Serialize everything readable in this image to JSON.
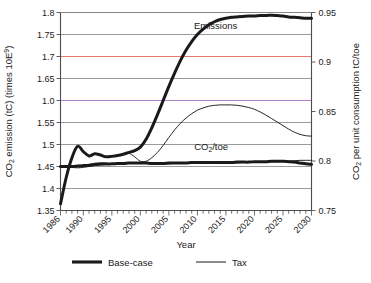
{
  "chart_data": {
    "type": "line",
    "title": "",
    "xlabel": "Year",
    "ylabel": "CO2 emission (tC) (times 10E9)",
    "ylabel_parts": {
      "pre": "CO",
      "sub": "2",
      "mid": " emission (tC) (times 10E",
      "sup": "9",
      "post": ")"
    },
    "y2label": "CO2 per unit consumption tC/toe",
    "y2label_parts": {
      "pre": "CO",
      "sub": "2",
      "post": " per unit consumption tC/toe"
    },
    "xlim": [
      1986,
      2030
    ],
    "ylim": [
      1.35,
      1.8
    ],
    "y2lim": [
      0.75,
      0.95
    ],
    "grid": true,
    "legend_position": "bottom",
    "xticks": [
      1986,
      1990,
      1995,
      2000,
      2005,
      2010,
      2015,
      2020,
      2025,
      2030
    ],
    "xtick_labels": [
      "1986",
      "1990",
      "1995",
      "2000",
      "2005",
      "2010",
      "2015",
      "2020",
      "2025",
      "2030"
    ],
    "xminor_step": 1,
    "yticks": [
      1.35,
      1.4,
      1.45,
      1.5,
      1.55,
      1.6,
      1.65,
      1.7,
      1.75,
      1.8
    ],
    "ytick_labels": [
      "1.35",
      "1.4",
      "1.45",
      "1.5",
      "1.55",
      "1.0",
      "1.65",
      "1.7",
      "1.75",
      "1.8"
    ],
    "y2ticks": [
      0.75,
      0.8,
      0.85,
      0.9,
      0.95
    ],
    "y2tick_labels": [
      "0.75",
      "0.8",
      "0.85",
      "0.9",
      "0.95"
    ],
    "gridline_colors": {
      "default": "#808080",
      "1.7": "#e8796f",
      "1.6": "#b07fc4"
    },
    "annotations": [
      {
        "name": "emissions-label",
        "text": "Emissions",
        "x": 2013.2,
        "y": 1.762
      },
      {
        "name": "co2-per-toe-label",
        "text": "CO2/toe",
        "parts": {
          "pre": "CO",
          "sub": "2",
          "post": "/toe"
        },
        "x": 2012.4,
        "y": 1.487
      }
    ],
    "legend": [
      {
        "label": "Base-case",
        "style": "thick",
        "color": "#1a1a1a",
        "width": 3.1
      },
      {
        "label": "Tax",
        "style": "thin",
        "color": "#1a1a1a",
        "width": 1.0
      }
    ],
    "series": [
      {
        "name": "Emissions Base-case",
        "scale": "left",
        "style": "thick",
        "x": [
          1986,
          1987,
          1988,
          1989,
          1990,
          1991,
          1992,
          1993,
          1994,
          1995,
          1996,
          1997,
          1998,
          1999,
          2000,
          2001,
          2002,
          2003,
          2004,
          2005,
          2006,
          2007,
          2008,
          2009,
          2010,
          2011,
          2012,
          2013,
          2014,
          2015,
          2016,
          2017,
          2018,
          2019,
          2020,
          2021,
          2022,
          2023,
          2024,
          2025,
          2026,
          2027,
          2028,
          2029,
          2030
        ],
        "values": [
          1.365,
          1.425,
          1.47,
          1.496,
          1.484,
          1.474,
          1.479,
          1.476,
          1.472,
          1.473,
          1.475,
          1.478,
          1.482,
          1.486,
          1.494,
          1.512,
          1.538,
          1.568,
          1.6,
          1.632,
          1.662,
          1.69,
          1.714,
          1.734,
          1.75,
          1.762,
          1.772,
          1.779,
          1.784,
          1.787,
          1.789,
          1.79,
          1.791,
          1.792,
          1.792,
          1.793,
          1.793,
          1.794,
          1.793,
          1.792,
          1.79,
          1.789,
          1.788,
          1.787,
          1.787
        ]
      },
      {
        "name": "Emissions Tax",
        "scale": "left",
        "style": "thin",
        "x": [
          1986,
          1987,
          1988,
          1989,
          1990,
          1991,
          1992,
          1993,
          1994,
          1995,
          1996,
          1997,
          1998,
          1999,
          2000,
          2001,
          2002,
          2003,
          2004,
          2005,
          2006,
          2007,
          2008,
          2009,
          2010,
          2011,
          2012,
          2013,
          2014,
          2015,
          2016,
          2017,
          2018,
          2019,
          2020,
          2021,
          2022,
          2023,
          2024,
          2025,
          2026,
          2027,
          2028,
          2029,
          2030
        ],
        "values": [
          1.365,
          1.425,
          1.47,
          1.496,
          1.484,
          1.474,
          1.479,
          1.476,
          1.472,
          1.473,
          1.475,
          1.478,
          1.48,
          1.472,
          1.462,
          1.462,
          1.47,
          1.482,
          1.498,
          1.516,
          1.533,
          1.548,
          1.56,
          1.57,
          1.578,
          1.583,
          1.587,
          1.589,
          1.59,
          1.59,
          1.59,
          1.589,
          1.587,
          1.584,
          1.58,
          1.574,
          1.567,
          1.559,
          1.551,
          1.543,
          1.535,
          1.528,
          1.523,
          1.52,
          1.519
        ]
      },
      {
        "name": "CO2/toe Base-case",
        "scale": "left",
        "style": "thick",
        "x": [
          1986,
          1987,
          1988,
          1989,
          1990,
          1991,
          1992,
          1993,
          1994,
          1995,
          1996,
          1997,
          1998,
          1999,
          2000,
          2001,
          2002,
          2003,
          2004,
          2005,
          2006,
          2007,
          2008,
          2009,
          2010,
          2011,
          2012,
          2013,
          2014,
          2015,
          2016,
          2017,
          2018,
          2019,
          2020,
          2021,
          2022,
          2023,
          2024,
          2025,
          2026,
          2027,
          2028,
          2029,
          2030
        ],
        "values": [
          1.45,
          1.45,
          1.45,
          1.451,
          1.452,
          1.453,
          1.455,
          1.456,
          1.456,
          1.456,
          1.457,
          1.457,
          1.458,
          1.458,
          1.458,
          1.458,
          1.457,
          1.457,
          1.457,
          1.458,
          1.458,
          1.458,
          1.458,
          1.459,
          1.459,
          1.459,
          1.459,
          1.459,
          1.459,
          1.459,
          1.459,
          1.46,
          1.46,
          1.46,
          1.461,
          1.461,
          1.461,
          1.462,
          1.462,
          1.462,
          1.461,
          1.46,
          1.458,
          1.456,
          1.455
        ]
      },
      {
        "name": "CO2/toe Tax",
        "scale": "left",
        "style": "thin",
        "x": [
          1986,
          1987,
          1988,
          1989,
          1990,
          1991,
          1992,
          1993,
          1994,
          1995,
          1996,
          1997,
          1998,
          1999,
          2000,
          2001,
          2002,
          2003,
          2004,
          2005,
          2006,
          2007,
          2008,
          2009,
          2010,
          2011,
          2012,
          2013,
          2014,
          2015,
          2016,
          2017,
          2018,
          2019,
          2020,
          2021,
          2022,
          2023,
          2024,
          2025,
          2026,
          2027,
          2028,
          2029,
          2030
        ],
        "values": [
          1.452,
          1.45,
          1.448,
          1.447,
          1.448,
          1.45,
          1.452,
          1.453,
          1.454,
          1.455,
          1.456,
          1.456,
          1.457,
          1.457,
          1.457,
          1.457,
          1.456,
          1.456,
          1.456,
          1.456,
          1.457,
          1.457,
          1.457,
          1.457,
          1.458,
          1.458,
          1.458,
          1.458,
          1.458,
          1.458,
          1.458,
          1.458,
          1.459,
          1.459,
          1.459,
          1.46,
          1.46,
          1.461,
          1.461,
          1.462,
          1.462,
          1.463,
          1.464,
          1.464,
          1.464
        ]
      }
    ]
  }
}
